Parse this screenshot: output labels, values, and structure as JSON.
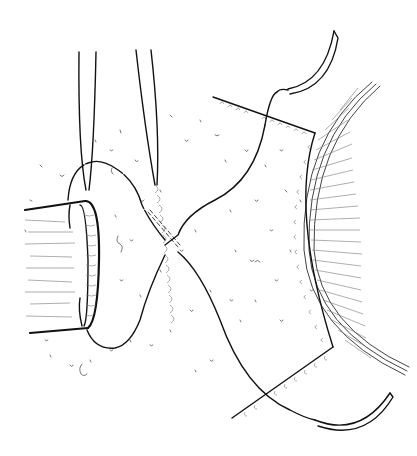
{
  "illustration": {
    "title": "",
    "subject": "surgical suture illustration",
    "elements": [
      {
        "name": "vessel-stump",
        "description": "cut tubular structure on left with hatched lumen"
      },
      {
        "name": "forceps",
        "description": "two pairs of forceps tips from top"
      },
      {
        "name": "suture-thread",
        "description": "double-armed suture crossing in an X"
      },
      {
        "name": "upper-needle",
        "description": "curved needle at top right"
      },
      {
        "name": "lower-needle",
        "description": "curved needle at bottom right"
      },
      {
        "name": "tissue-flap",
        "description": "tissue patch with stitched edges"
      },
      {
        "name": "globe-arc",
        "description": "curved organ surface with radial hatching on right"
      }
    ],
    "colors": {
      "ink": "#111111",
      "background": "#ffffff"
    }
  }
}
